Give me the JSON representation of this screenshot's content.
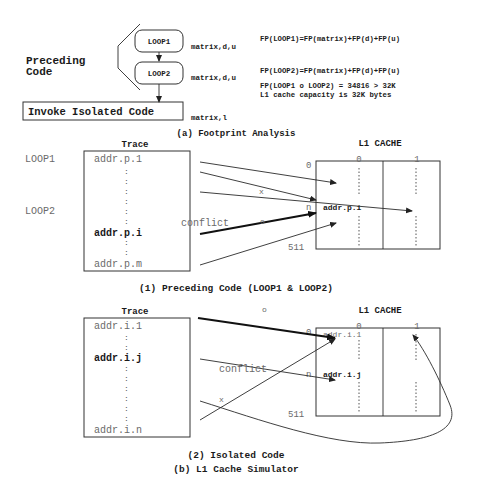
{
  "footprint": {
    "group_label_line1": "Preceding",
    "group_label_line2": "Code",
    "loop1": "LOOP1",
    "loop2": "LOOP2",
    "invoke": "Invoke Isolated Code",
    "loop1_vars": "matrix,d,u",
    "loop2_vars": "matrix,d,u",
    "invoke_vars": "matrix,l",
    "eq1": "FP(LOOP1)=FP(matrix)+FP(d)+FP(u)",
    "eq2": "FP(LOOP2)=FP(matrix)+FP(d)+FP(u)",
    "eq3": "FP(LOOP1 o LOOP2) = 34816 > 32K",
    "eq4": "L1 cache capacity is 32K bytes",
    "caption": "(a) Footprint Analysis"
  },
  "preceding": {
    "trace_title": "Trace",
    "cache_title": "L1 CACHE",
    "loop1_label": "LOOP1",
    "loop2_label": "LOOP2",
    "trace_first": "addr.p.1",
    "trace_bold": "addr.p.i",
    "trace_last": "addr.p.m",
    "col0": "0",
    "col1": "1",
    "row0": "0",
    "rown": "n",
    "row511": "511",
    "cache_entry": "addr.p.i",
    "conflict": "conflict",
    "conflict_mark": "o",
    "x_mark": "x",
    "caption": "(1) Preceding Code (LOOP1 & LOOP2)"
  },
  "isolated": {
    "trace_title": "Trace",
    "cache_title": "L1 CACHE",
    "trace_first": "addr.i.1",
    "trace_bold": "addr.i.j",
    "trace_last": "addr.i.n",
    "col0": "0",
    "col1": "1",
    "row0": "0",
    "rown": "n",
    "row511": "511",
    "cache_entry_top": "addr.i.1",
    "cache_entry_n": "addr.i.j",
    "conflict": "conflict",
    "o_mark": "o",
    "x_mark": "x",
    "caption": "(2) Isolated Code"
  },
  "figure_caption": "(b) L1 Cache Simulator"
}
